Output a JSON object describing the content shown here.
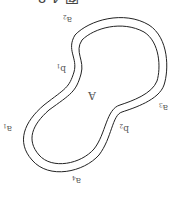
{
  "diagram": {
    "orientation": "rotated-180",
    "title_fragment": "图 4-8",
    "region_label": "A",
    "labels": [
      {
        "id": "a1",
        "base": "a",
        "sub": "1"
      },
      {
        "id": "a2",
        "base": "a",
        "sub": "2"
      },
      {
        "id": "a3",
        "base": "a",
        "sub": "3"
      },
      {
        "id": "a4",
        "base": "a",
        "sub": "4"
      },
      {
        "id": "b1",
        "base": "b",
        "sub": "1"
      },
      {
        "id": "b2",
        "base": "b",
        "sub": "2"
      }
    ],
    "colors": {
      "stroke": "#222222",
      "text": "#555555",
      "background": "#ffffff"
    }
  }
}
